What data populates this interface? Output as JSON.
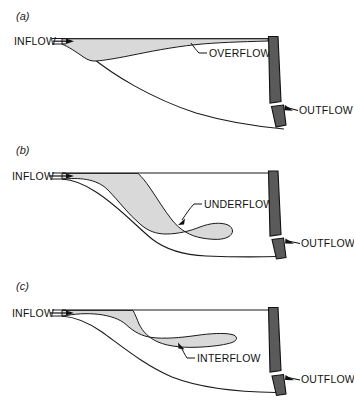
{
  "figure": {
    "width": 354,
    "height": 402,
    "background": "#ffffff"
  },
  "colors": {
    "plume_fill": "#d9d9d9",
    "dam_fill": "#5a5a5a",
    "gate_fill": "#5a5a5a",
    "line": "#1a1a1a",
    "text": "#111111",
    "background": "#ffffff"
  },
  "panels": [
    {
      "id": "a",
      "label": "(a)",
      "flow_type": "OVERFLOW",
      "inflow_label": "INFLOW",
      "outflow_label": "OUTFLOW",
      "plume_label": "OVERFLOW",
      "description": "Buoyant inflow spreads along the water surface as an overflow toward the dam"
    },
    {
      "id": "b",
      "label": "(b)",
      "flow_type": "UNDERFLOW",
      "inflow_label": "INFLOW",
      "outflow_label": "OUTFLOW",
      "plume_label": "UNDERFLOW",
      "description": "Dense inflow plunges and travels along the reservoir bed as an underflow"
    },
    {
      "id": "c",
      "label": "(c)",
      "flow_type": "INTERFLOW",
      "inflow_label": "INFLOW",
      "outflow_label": "OUTFLOW",
      "plume_label": "INTERFLOW",
      "description": "Inflow plunges then spreads at an intermediate depth as an interflow tongue"
    }
  ],
  "icons": {
    "inflow_arrow": "inflow-arrow-icon",
    "outflow_arrow": "outflow-arrow-icon",
    "leader_line": "leader-line-icon"
  }
}
